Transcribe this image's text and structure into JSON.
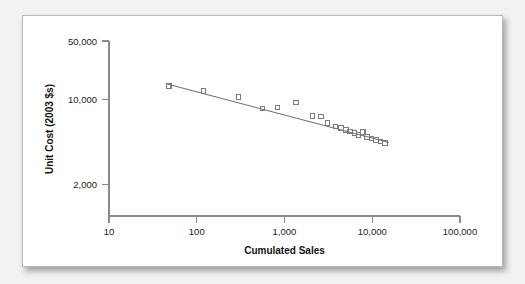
{
  "chart_data": {
    "type": "scatter",
    "title": "",
    "xlabel": "Cumulated Sales",
    "ylabel": "Unit Cost (2003 $s)",
    "xscale": "log",
    "yscale": "log",
    "xlim": [
      10,
      100000
    ],
    "ylim": [
      2000,
      50000
    ],
    "grid": false,
    "legend": null,
    "xticks": [
      "10",
      "100",
      "1,000",
      "10,000",
      "100,000"
    ],
    "xtick_values": [
      10,
      100,
      1000,
      10000,
      100000
    ],
    "yticks": [
      "50,000",
      "10,000",
      "2,000"
    ],
    "ytick_values": [
      50000,
      10000,
      2000
    ],
    "series": [
      {
        "name": "Unit cost observations",
        "marker": "open-square",
        "marker_color": "#7a7a84",
        "points": [
          {
            "x": 48,
            "y": 18200
          },
          {
            "x": 120,
            "y": 16200
          },
          {
            "x": 300,
            "y": 14200
          },
          {
            "x": 560,
            "y": 11000
          },
          {
            "x": 830,
            "y": 11200
          },
          {
            "x": 1350,
            "y": 12600
          },
          {
            "x": 2100,
            "y": 9300
          },
          {
            "x": 2600,
            "y": 9200
          },
          {
            "x": 3100,
            "y": 7900
          },
          {
            "x": 3800,
            "y": 7350
          },
          {
            "x": 4400,
            "y": 7050
          },
          {
            "x": 5000,
            "y": 6750
          },
          {
            "x": 5600,
            "y": 6500
          },
          {
            "x": 6300,
            "y": 6300
          },
          {
            "x": 7000,
            "y": 6050
          },
          {
            "x": 7800,
            "y": 6450
          },
          {
            "x": 8700,
            "y": 5800
          },
          {
            "x": 9800,
            "y": 5600
          },
          {
            "x": 11000,
            "y": 5400
          },
          {
            "x": 12500,
            "y": 5200
          },
          {
            "x": 14000,
            "y": 5050
          }
        ]
      }
    ],
    "fit_line": {
      "name": "Experience curve fit",
      "color": "#6e6e78",
      "x_start": 46,
      "y_start": 19000,
      "x_end": 15500,
      "y_end": 5100
    },
    "annotations": []
  },
  "figure": {
    "background_color": "#f2f2f2",
    "card_color": "#ffffff",
    "border_color": "#b9b9b9"
  }
}
